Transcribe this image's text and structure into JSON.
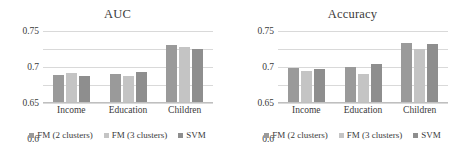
{
  "chart_data": [
    {
      "type": "bar",
      "title": "AUC",
      "xlabel": "",
      "ylabel": "",
      "categories": [
        "Income",
        "Education",
        "Children"
      ],
      "series": [
        {
          "name": "FM (2 clusters)",
          "values": [
            0.628,
            0.631,
            0.712
          ],
          "color": "#9a9a9a"
        },
        {
          "name": "FM (3 clusters)",
          "values": [
            0.633,
            0.624,
            0.705
          ],
          "color": "#c4c4c4"
        },
        {
          "name": "SVM",
          "values": [
            0.624,
            0.636,
            0.7
          ],
          "color": "#8e8e8e"
        }
      ],
      "ylim": [
        0.55,
        0.75
      ],
      "yticks": [
        "0.55",
        "0.6",
        "0.65",
        "0.7",
        "0.75"
      ],
      "ytick_values": [
        0.55,
        0.6,
        0.65,
        0.7,
        0.75
      ],
      "grid": true,
      "legend_position": "bottom"
    },
    {
      "type": "bar",
      "title": "Accuracy",
      "xlabel": "",
      "ylabel": "",
      "categories": [
        "Income",
        "Education",
        "Children"
      ],
      "series": [
        {
          "name": "FM (2 clusters)",
          "values": [
            0.646,
            0.65,
            0.718
          ],
          "color": "#9a9a9a"
        },
        {
          "name": "FM (3 clusters)",
          "values": [
            0.639,
            0.631,
            0.701
          ],
          "color": "#c4c4c4"
        },
        {
          "name": "SVM",
          "values": [
            0.644,
            0.658,
            0.715
          ],
          "color": "#8e8e8e"
        }
      ],
      "ylim": [
        0.55,
        0.75
      ],
      "yticks": [
        "0.55",
        "0.6",
        "0.65",
        "0.7",
        "0.75"
      ],
      "ytick_values": [
        0.55,
        0.6,
        0.65,
        0.7,
        0.75
      ],
      "grid": true,
      "legend_position": "bottom"
    }
  ]
}
